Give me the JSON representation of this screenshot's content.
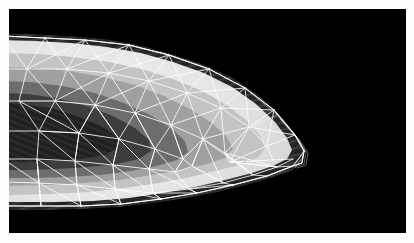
{
  "figure": {
    "title": "",
    "kind": "scalar-field-contour-with-triangular-mesh-overlay",
    "caption": "",
    "page_background": "#fdfdfd"
  },
  "plot": {
    "background_color": "#000000",
    "margin_left_px": 9,
    "margin_top_px": 9,
    "width_px": 397,
    "height_px": 224,
    "mesh_color": "#ffffff",
    "mesh_visible": true,
    "axes_visible": false,
    "ticks_visible": false,
    "legend_visible": false,
    "colorbar_visible": false
  },
  "chart_data": {
    "type": "heatmap",
    "title": "",
    "subtitle": "",
    "xlabel": "",
    "ylabel": "",
    "xlim": [
      0,
      397
    ],
    "ylim": [
      0,
      224
    ],
    "grid": false,
    "legend_position": "none",
    "colormap": "grayscale",
    "annotations": [],
    "tick_labels": {
      "x": [],
      "y": []
    },
    "contour_bands": [
      {
        "name": "outer-dark-rim",
        "level": 0.0,
        "color": "#2b2b2b",
        "label": ""
      },
      {
        "name": "bright-halo",
        "level": 0.15,
        "color": "#e6e6e6",
        "label": ""
      },
      {
        "name": "light-gray-band",
        "level": 0.35,
        "color": "#c2c2c2",
        "label": ""
      },
      {
        "name": "mid-gray-band",
        "level": 0.55,
        "color": "#a2a2a2",
        "label": ""
      },
      {
        "name": "dark-gray-band",
        "level": 0.72,
        "color": "#6e6e6e",
        "label": ""
      },
      {
        "name": "deep-core-band",
        "level": 0.88,
        "color": "#3c3c3c",
        "label": ""
      },
      {
        "name": "core-minimum",
        "level": 1.0,
        "color": "#202020",
        "label": ""
      }
    ],
    "domain_outline": [
      [
        0,
        27
      ],
      [
        24,
        28
      ],
      [
        60,
        30
      ],
      [
        96,
        33
      ],
      [
        130,
        39
      ],
      [
        163,
        48
      ],
      [
        196,
        58
      ],
      [
        226,
        72
      ],
      [
        252,
        89
      ],
      [
        272,
        108
      ],
      [
        286,
        126
      ],
      [
        294,
        141
      ],
      [
        292,
        152
      ],
      [
        281,
        160
      ],
      [
        262,
        166
      ],
      [
        238,
        173
      ],
      [
        210,
        180
      ],
      [
        178,
        187
      ],
      [
        146,
        192
      ],
      [
        112,
        195
      ],
      [
        76,
        197
      ],
      [
        40,
        197
      ],
      [
        0,
        197
      ]
    ],
    "mesh_vertices": [
      [
        0,
        27
      ],
      [
        36,
        29
      ],
      [
        76,
        31
      ],
      [
        120,
        36
      ],
      [
        160,
        46
      ],
      [
        200,
        60
      ],
      [
        236,
        79
      ],
      [
        265,
        101
      ],
      [
        286,
        126
      ],
      [
        294,
        141
      ],
      [
        284,
        157
      ],
      [
        258,
        167
      ],
      [
        224,
        176
      ],
      [
        188,
        184
      ],
      [
        152,
        190
      ],
      [
        112,
        195
      ],
      [
        72,
        197
      ],
      [
        32,
        197
      ],
      [
        0,
        197
      ],
      [
        18,
        60
      ],
      [
        58,
        60
      ],
      [
        100,
        64
      ],
      [
        140,
        72
      ],
      [
        178,
        84
      ],
      [
        212,
        99
      ],
      [
        240,
        118
      ],
      [
        258,
        137
      ],
      [
        262,
        151
      ],
      [
        240,
        158
      ],
      [
        206,
        164
      ],
      [
        170,
        171
      ],
      [
        132,
        177
      ],
      [
        94,
        181
      ],
      [
        54,
        183
      ],
      [
        16,
        183
      ],
      [
        10,
        92
      ],
      [
        46,
        92
      ],
      [
        86,
        96
      ],
      [
        126,
        104
      ],
      [
        162,
        116
      ],
      [
        194,
        130
      ],
      [
        216,
        144
      ],
      [
        220,
        152
      ],
      [
        196,
        157
      ],
      [
        160,
        161
      ],
      [
        122,
        166
      ],
      [
        82,
        170
      ],
      [
        42,
        171
      ],
      [
        30,
        122
      ],
      [
        70,
        124
      ],
      [
        110,
        130
      ],
      [
        146,
        140
      ],
      [
        174,
        150
      ],
      [
        182,
        156
      ],
      [
        150,
        160
      ],
      [
        110,
        163
      ],
      [
        70,
        166
      ]
    ],
    "series": [
      {
        "name": "scalar-field",
        "values_min": 0.0,
        "values_max": 1.0
      }
    ]
  }
}
